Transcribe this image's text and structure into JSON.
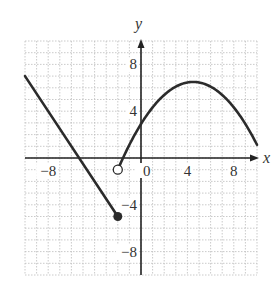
{
  "chart_data": {
    "type": "line",
    "title": "",
    "xlabel": "x",
    "ylabel": "y",
    "xlim": [
      -10,
      10
    ],
    "ylim": [
      -10,
      10
    ],
    "grid": true,
    "grid_step": 1,
    "x_ticks": [
      -8,
      0,
      4,
      8
    ],
    "y_ticks": [
      8,
      4,
      -4,
      -8
    ],
    "x_tick_labels": [
      "−8",
      "0",
      "4",
      "8"
    ],
    "y_tick_labels": [
      "8",
      "4",
      "−4",
      "−8"
    ],
    "series": [
      {
        "name": "linear piece",
        "kind": "segment",
        "points": [
          [
            -10,
            7
          ],
          [
            -2,
            -5
          ]
        ],
        "endpoint": {
          "x": -2,
          "y": -5,
          "style": "closed"
        }
      },
      {
        "name": "curved piece",
        "kind": "parabola",
        "vertex": [
          4.5,
          6.5
        ],
        "points": [
          [
            -2,
            -1
          ],
          [
            -1,
            1.1
          ],
          [
            0,
            2.9
          ],
          [
            1,
            4.35
          ],
          [
            2,
            5.4
          ],
          [
            3,
            6.1
          ],
          [
            4,
            6.45
          ],
          [
            4.5,
            6.5
          ],
          [
            5,
            6.45
          ],
          [
            6,
            6.1
          ],
          [
            7,
            5.4
          ],
          [
            8,
            4.35
          ],
          [
            9,
            2.9
          ],
          [
            10,
            1.1
          ]
        ],
        "startpoint": {
          "x": -2,
          "y": -1,
          "style": "open"
        }
      }
    ]
  },
  "labels": {
    "x_axis": "x",
    "y_axis": "y",
    "origin": "0"
  },
  "colors": {
    "curve": "#2b2b2b",
    "axis": "#222222",
    "grid": "#bdbdbd"
  }
}
